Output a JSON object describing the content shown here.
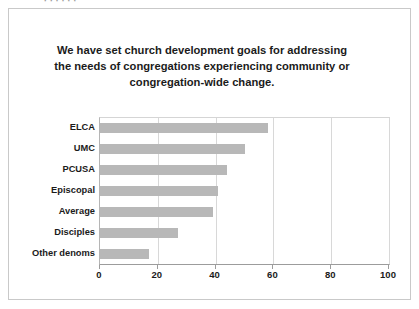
{
  "slide": {
    "top_cut_text": "·      ·          ·            ·               ·        ·"
  },
  "chart_data": {
    "type": "bar",
    "orientation": "horizontal",
    "title_lines": [
      "We have set church development goals for addressing",
      "the needs of congregations experiencing community or",
      "congregation-wide change."
    ],
    "xlabel": "",
    "ylabel": "",
    "categories": [
      "ELCA",
      "UMC",
      "PCUSA",
      "Episcopal",
      "Average",
      "Disciples",
      "Other denoms"
    ],
    "values": [
      58,
      50,
      44,
      41,
      39,
      27,
      17
    ],
    "xlim": [
      0,
      100
    ],
    "xticks": [
      0,
      20,
      40,
      60,
      80,
      100
    ],
    "xtick_labels": [
      "0",
      "20",
      "40",
      "60",
      "80",
      "100"
    ],
    "grid": true,
    "grid_axis": "x",
    "legend": false,
    "bar_color": "#b8b8b8",
    "gridline_color": "#d8d8d8",
    "axis_color": "#9c9c9c",
    "text_color": "#1b1b1b",
    "background_color": "#ffffff",
    "frame_color": "#c9c9c9"
  }
}
